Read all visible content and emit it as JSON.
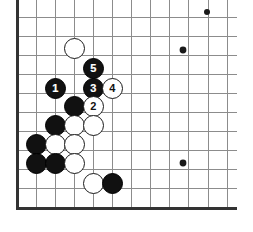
{
  "diagram": {
    "type": "go-board-diagram",
    "board": {
      "background_color": "#ffffff",
      "line_color": "#8c8c8c",
      "edge_color": "#333333",
      "edge_line_width": 3,
      "grid_line_width": 1,
      "origin_x": 17,
      "origin_y": 17,
      "spacing": 19.1,
      "columns": 12,
      "rows": 11,
      "left_edge_is_board_edge": true,
      "bottom_edge_is_board_edge": true
    },
    "star_points": [
      {
        "x": 207,
        "y": 12,
        "radius": 3.0,
        "clipped": true
      },
      {
        "x": 183,
        "y": 50,
        "radius": 3.4,
        "clipped": false
      },
      {
        "x": 183,
        "y": 163,
        "radius": 3.4,
        "clipped": false
      }
    ],
    "stones": [
      {
        "color": "white",
        "label": "",
        "x": 74,
        "y": 48,
        "radius": 10.5
      },
      {
        "color": "black",
        "label": "5",
        "x": 93,
        "y": 68,
        "radius": 10.5
      },
      {
        "color": "black",
        "label": "1",
        "x": 55,
        "y": 88,
        "radius": 10.5
      },
      {
        "color": "black",
        "label": "3",
        "x": 93,
        "y": 88,
        "radius": 10.5
      },
      {
        "color": "white",
        "label": "4",
        "x": 112,
        "y": 88,
        "radius": 10.5
      },
      {
        "color": "black",
        "label": "",
        "x": 74,
        "y": 106,
        "radius": 10.5
      },
      {
        "color": "white",
        "label": "2",
        "x": 93,
        "y": 106,
        "radius": 10.5
      },
      {
        "color": "black",
        "label": "",
        "x": 55,
        "y": 125,
        "radius": 10.5
      },
      {
        "color": "white",
        "label": "",
        "x": 74,
        "y": 125,
        "radius": 10.5
      },
      {
        "color": "white",
        "label": "",
        "x": 93,
        "y": 125,
        "radius": 10.5
      },
      {
        "color": "black",
        "label": "",
        "x": 36,
        "y": 144,
        "radius": 10.5
      },
      {
        "color": "white",
        "label": "",
        "x": 55,
        "y": 144,
        "radius": 10.5
      },
      {
        "color": "white",
        "label": "",
        "x": 74,
        "y": 144,
        "radius": 10.5
      },
      {
        "color": "black",
        "label": "",
        "x": 36,
        "y": 163,
        "radius": 10.5
      },
      {
        "color": "black",
        "label": "",
        "x": 55,
        "y": 163,
        "radius": 10.5
      },
      {
        "color": "white",
        "label": "",
        "x": 74,
        "y": 163,
        "radius": 10.5
      },
      {
        "color": "white",
        "label": "",
        "x": 93,
        "y": 183,
        "radius": 10.5
      },
      {
        "color": "black",
        "label": "",
        "x": 112,
        "y": 183,
        "radius": 10.5
      }
    ],
    "move_sequence": [
      {
        "number": "1",
        "color": "black"
      },
      {
        "number": "2",
        "color": "white"
      },
      {
        "number": "3",
        "color": "black"
      },
      {
        "number": "4",
        "color": "white"
      },
      {
        "number": "5",
        "color": "black"
      }
    ]
  }
}
